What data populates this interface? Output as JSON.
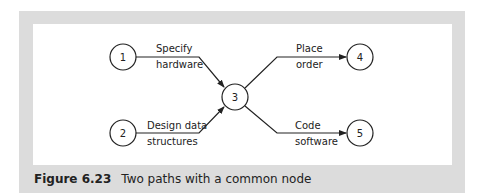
{
  "diagram": {
    "nodes": [
      {
        "id": "1",
        "label": "1",
        "cx": 123,
        "cy": 57
      },
      {
        "id": "2",
        "label": "2",
        "cx": 123,
        "cy": 133
      },
      {
        "id": "3",
        "label": "3",
        "cx": 235,
        "cy": 97
      },
      {
        "id": "4",
        "label": "4",
        "cx": 360,
        "cy": 57
      },
      {
        "id": "5",
        "label": "5",
        "cx": 360,
        "cy": 133
      }
    ],
    "edges": [
      {
        "from": "1",
        "to": "3",
        "label_line1": "Specify",
        "label_line2": "hardware"
      },
      {
        "from": "2",
        "to": "3",
        "label_line1": "Design data",
        "label_line2": "structures"
      },
      {
        "from": "3",
        "to": "4",
        "label_line1": "Place",
        "label_line2": "order"
      },
      {
        "from": "3",
        "to": "5",
        "label_line1": "Code",
        "label_line2": "software"
      }
    ]
  },
  "caption": {
    "figure_number": "Figure 6.23",
    "text": "Two paths with a common node"
  }
}
